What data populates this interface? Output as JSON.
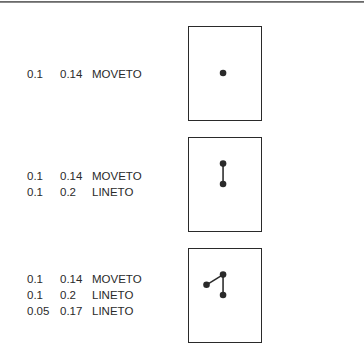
{
  "figure": {
    "ink_color": "#2a2a2a",
    "coordinate_window": {
      "x": [
        0.0,
        0.22
      ],
      "y": [
        0.0,
        0.28
      ]
    },
    "panels": [
      {
        "commands": [
          {
            "x": "0.1",
            "y": "0.14",
            "op": "MOVETO"
          }
        ]
      },
      {
        "commands": [
          {
            "x": "0.1",
            "y": "0.14",
            "op": "MOVETO"
          },
          {
            "x": "0.1",
            "y": "0.2",
            "op": "LINETO"
          }
        ]
      },
      {
        "commands": [
          {
            "x": "0.1",
            "y": "0.14",
            "op": "MOVETO"
          },
          {
            "x": "0.1",
            "y": "0.2",
            "op": "LINETO"
          },
          {
            "x": "0.05",
            "y": "0.17",
            "op": "LINETO"
          }
        ]
      }
    ]
  }
}
